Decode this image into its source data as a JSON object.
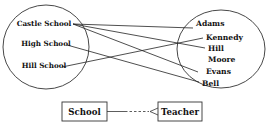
{
  "diagram": {
    "type": "mapping",
    "left_set": {
      "name": "schools",
      "items": [
        "Castle School",
        "High School",
        "Hill School"
      ]
    },
    "right_set": {
      "name": "teachers",
      "items": [
        "Adams",
        "Kennedy",
        "Hill",
        "Moore",
        "Evans",
        "Bell"
      ]
    },
    "mappings": [
      {
        "from": "Castle School",
        "to": "Adams"
      },
      {
        "from": "Castle School",
        "to": "Hill"
      },
      {
        "from": "Castle School",
        "to": "Evans"
      },
      {
        "from": "High School",
        "to": "Bell"
      },
      {
        "from": "Hill School",
        "to": "Kennedy"
      }
    ],
    "legend": {
      "left_box": "School",
      "right_box": "Teacher",
      "relationship": "one-to-many (crow's foot, dashed optional)"
    }
  }
}
